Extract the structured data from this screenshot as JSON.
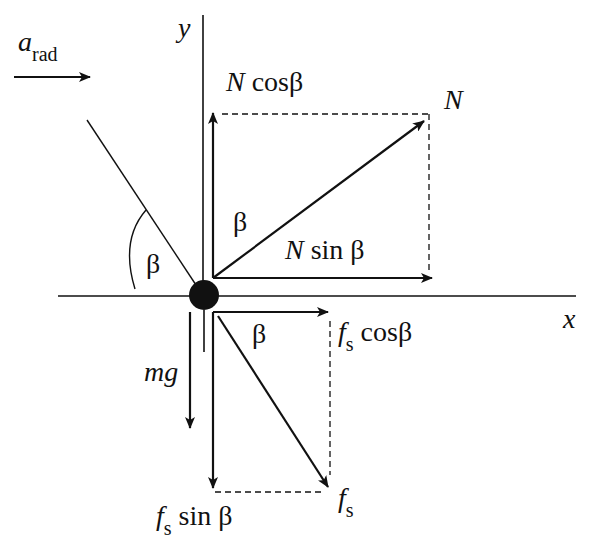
{
  "diagram": {
    "axes": {
      "x_label": "x",
      "y_label": "y"
    },
    "acceleration": {
      "symbol": "a",
      "subscript": "rad"
    },
    "angle_symbol": "β",
    "forces": {
      "normal": {
        "label": "N"
      },
      "normal_x": {
        "symbol": "N",
        "func": "sin β"
      },
      "normal_y": {
        "symbol": "N",
        "func": "cosβ"
      },
      "friction": {
        "symbol": "f",
        "subscript": "s"
      },
      "friction_x": {
        "symbol": "f",
        "subscript": "s",
        "func": "cosβ"
      },
      "friction_y": {
        "symbol": "f",
        "subscript": "s",
        "func": "sin β"
      },
      "weight": {
        "label": "mg"
      }
    },
    "angle_labels": [
      "β",
      "β",
      "β"
    ],
    "colors": {
      "ink": "#111111",
      "background": "#ffffff"
    }
  }
}
